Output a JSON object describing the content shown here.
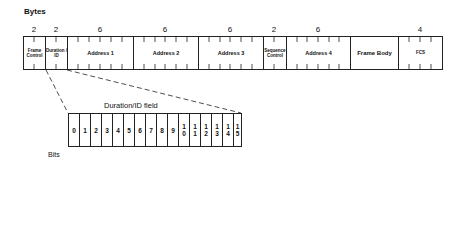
{
  "diagram": {
    "bytes_label": "Bytes",
    "bits_label": "Bits",
    "frame_fields": [
      {
        "name": "Frame Control",
        "bytes": "2",
        "x1": 23,
        "x2": 45
      },
      {
        "name": "Duration / ID",
        "bytes": "2",
        "x1": 45,
        "x2": 67
      },
      {
        "name": "Address 1",
        "bytes": "6",
        "x1": 67,
        "x2": 133
      },
      {
        "name": "Address 2",
        "bytes": "6",
        "x1": 133,
        "x2": 198
      },
      {
        "name": "Address 3",
        "bytes": "6",
        "x1": 198,
        "x2": 263
      },
      {
        "name": "Sequence Control",
        "bytes": "2",
        "x1": 263,
        "x2": 286
      },
      {
        "name": "Address 4",
        "bytes": "6",
        "x1": 286,
        "x2": 350
      },
      {
        "name": "Frame Body",
        "bytes": "",
        "x1": 350,
        "x2": 398
      },
      {
        "name": "FCS",
        "bytes": "4",
        "x1": 398,
        "x2": 443
      }
    ],
    "expanded_field": {
      "title": "Duration/ID field",
      "bits": [
        "0",
        "1",
        "2",
        "3",
        "4",
        "5",
        "6",
        "7",
        "8",
        "9",
        "10",
        "11",
        "12",
        "13",
        "14",
        "15"
      ]
    }
  }
}
